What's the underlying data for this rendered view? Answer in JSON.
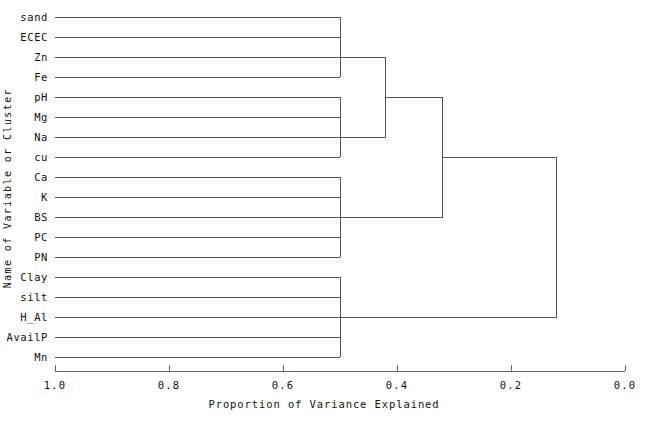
{
  "chart_data": {
    "type": "dendrogram",
    "title": "",
    "xlabel": "Proportion of Variance Explained",
    "ylabel": "Name of Variable or Cluster",
    "x_axis_reversed": true,
    "xlim": [
      1.0,
      0.0
    ],
    "xticks": [
      1.0,
      0.8,
      0.6,
      0.4,
      0.2,
      0.0
    ],
    "xtick_labels": [
      "1.0",
      "0.8",
      "0.6",
      "0.4",
      "0.2",
      "0.0"
    ],
    "grid": false,
    "legend": null,
    "leaves": [
      "sand",
      "ECEC",
      "Zn",
      "Fe",
      "pH",
      "Mg",
      "Na",
      "cu",
      "Ca",
      "K",
      "BS",
      "PC",
      "PN",
      "Clay",
      "silt",
      "H_Al",
      "AvailP",
      "Mn"
    ],
    "leaf_count": 18,
    "leaf_start_value": 1.0,
    "clusters": [
      {
        "name": "cluster-sand-ECEC-Zn-Fe",
        "members": [
          "sand",
          "ECEC",
          "Zn",
          "Fe"
        ],
        "merge_value": 0.5
      },
      {
        "name": "cluster-pH-Mg-Na-cu",
        "members": [
          "pH",
          "Mg",
          "Na",
          "cu"
        ],
        "merge_value": 0.5
      },
      {
        "name": "cluster-Ca-K-BS-PC-PN",
        "members": [
          "Ca",
          "K",
          "BS",
          "PC",
          "PN"
        ],
        "merge_value": 0.5
      },
      {
        "name": "cluster-Clay-silt-HAl-AvailP-Mn",
        "members": [
          "Clay",
          "silt",
          "H_Al",
          "AvailP",
          "Mn"
        ],
        "merge_value": 0.5
      },
      {
        "name": "cluster-upper-eight",
        "members": [
          "cluster-sand-ECEC-Zn-Fe",
          "cluster-pH-Mg-Na-cu"
        ],
        "merge_value": 0.42
      },
      {
        "name": "cluster-upper-thirteen",
        "members": [
          "cluster-upper-eight",
          "cluster-Ca-K-BS-PC-PN"
        ],
        "merge_value": 0.32
      },
      {
        "name": "root-cluster",
        "members": [
          "cluster-upper-thirteen",
          "cluster-Clay-silt-HAl-AvailP-Mn"
        ],
        "merge_value": 0.12
      }
    ]
  },
  "axis": {
    "x_title": "Proportion of Variance Explained",
    "y_title": "Name of Variable or Cluster",
    "ticks": [
      "1.0",
      "0.8",
      "0.6",
      "0.4",
      "0.2",
      "0.0"
    ]
  },
  "style": {
    "line_color": "#4a4a4a",
    "text_color": "#111111",
    "background": "#ffffff"
  }
}
